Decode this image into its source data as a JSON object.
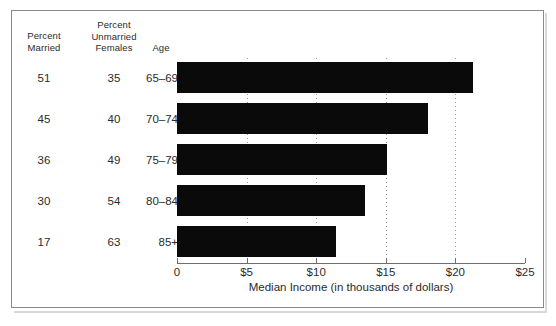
{
  "figure": {
    "frame_color": "#8a8a8a",
    "background": "#ffffff"
  },
  "table": {
    "headers": {
      "married": "Percent\nMarried",
      "married_line1": "Percent",
      "married_line2": "Married",
      "unmarried_line1": "Percent",
      "unmarried_line2": "Unmarried",
      "unmarried_line3": "Females",
      "age": "Age"
    },
    "rows": [
      {
        "percent_married": "51",
        "percent_unmarried_females": "35",
        "age": "65–69"
      },
      {
        "percent_married": "45",
        "percent_unmarried_females": "40",
        "age": "70–74"
      },
      {
        "percent_married": "36",
        "percent_unmarried_females": "49",
        "age": "75–79"
      },
      {
        "percent_married": "30",
        "percent_unmarried_females": "54",
        "age": "80–84"
      },
      {
        "percent_married": "17",
        "percent_unmarried_females": "63",
        "age": "85+"
      }
    ]
  },
  "chart_data": {
    "type": "bar",
    "orientation": "horizontal",
    "title": "",
    "xlabel": "Median Income (in thousands of dollars)",
    "ylabel": "Age",
    "categories": [
      "65–69",
      "70–74",
      "75–79",
      "80–84",
      "85+"
    ],
    "values": [
      21.3,
      18.0,
      15.1,
      13.5,
      11.4
    ],
    "xlim": [
      0,
      25
    ],
    "xticks": [
      0,
      5,
      10,
      15,
      20,
      25
    ],
    "xticklabels": [
      "0",
      "$5",
      "$10",
      "$15",
      "$20",
      "$25"
    ],
    "gridlines_at": [
      5,
      10,
      15,
      20
    ],
    "grid": "vertical-dotted",
    "legend": "none",
    "bar_color": "#0a0a0a",
    "series": [
      {
        "name": "Median Income",
        "values": [
          21.3,
          18.0,
          15.1,
          13.5,
          11.4
        ]
      }
    ],
    "extra_columns": [
      {
        "name": "Percent Married",
        "values": [
          51,
          45,
          36,
          30,
          17
        ]
      },
      {
        "name": "Percent Unmarried Females",
        "values": [
          35,
          40,
          49,
          54,
          63
        ]
      }
    ]
  }
}
